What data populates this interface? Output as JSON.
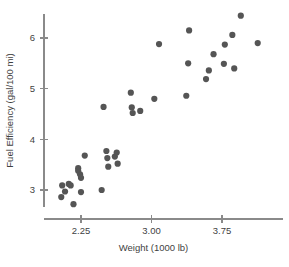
{
  "chart_data": {
    "type": "scatter",
    "title": "",
    "xlabel": "Weight (1000 lb)",
    "ylabel": "Fuel Efficiency (gal/100 mi)",
    "xlim": [
      1.95,
      4.25
    ],
    "ylim": [
      2.55,
      6.65
    ],
    "xticks": [
      2.25,
      3.0,
      3.75
    ],
    "xtick_labels": [
      "2.25",
      "3.00",
      "3.75"
    ],
    "yticks": [
      3,
      4,
      5,
      6
    ],
    "ytick_labels": [
      "3",
      "4",
      "5",
      "6"
    ],
    "grid": false,
    "legend": false,
    "marker_color": "#555555",
    "marker_size": 3.1,
    "axis_color": "#8a8a8a",
    "background_color": "#ffffff",
    "points": [
      {
        "x": 2.04,
        "y": 2.86
      },
      {
        "x": 2.05,
        "y": 3.09
      },
      {
        "x": 2.08,
        "y": 2.97
      },
      {
        "x": 2.12,
        "y": 3.12
      },
      {
        "x": 2.14,
        "y": 3.09
      },
      {
        "x": 2.17,
        "y": 2.72
      },
      {
        "x": 2.22,
        "y": 3.43
      },
      {
        "x": 2.22,
        "y": 3.38
      },
      {
        "x": 2.24,
        "y": 3.31
      },
      {
        "x": 2.25,
        "y": 3.24
      },
      {
        "x": 2.25,
        "y": 2.96
      },
      {
        "x": 2.29,
        "y": 3.68
      },
      {
        "x": 2.47,
        "y": 3.0
      },
      {
        "x": 2.49,
        "y": 4.64
      },
      {
        "x": 2.52,
        "y": 3.77
      },
      {
        "x": 2.53,
        "y": 3.63
      },
      {
        "x": 2.54,
        "y": 3.46
      },
      {
        "x": 2.61,
        "y": 3.66
      },
      {
        "x": 2.63,
        "y": 3.74
      },
      {
        "x": 2.64,
        "y": 3.52
      },
      {
        "x": 2.78,
        "y": 4.92
      },
      {
        "x": 2.79,
        "y": 4.63
      },
      {
        "x": 2.8,
        "y": 4.52
      },
      {
        "x": 2.88,
        "y": 4.56
      },
      {
        "x": 3.03,
        "y": 4.8
      },
      {
        "x": 3.08,
        "y": 5.88
      },
      {
        "x": 3.37,
        "y": 4.86
      },
      {
        "x": 3.39,
        "y": 5.5
      },
      {
        "x": 3.4,
        "y": 6.15
      },
      {
        "x": 3.58,
        "y": 5.19
      },
      {
        "x": 3.61,
        "y": 5.36
      },
      {
        "x": 3.66,
        "y": 5.68
      },
      {
        "x": 3.77,
        "y": 5.49
      },
      {
        "x": 3.78,
        "y": 5.87
      },
      {
        "x": 3.86,
        "y": 6.06
      },
      {
        "x": 3.88,
        "y": 5.4
      },
      {
        "x": 3.95,
        "y": 6.44
      },
      {
        "x": 4.13,
        "y": 5.9
      }
    ]
  }
}
